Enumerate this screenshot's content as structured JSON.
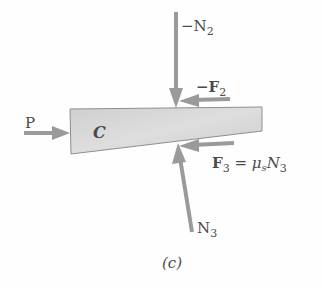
{
  "diagram": {
    "body": {
      "label": "C",
      "fill": "#d0d0d0",
      "stroke": "#8a8a8a"
    },
    "arrow_color": "#9a9a9a",
    "text_color": "#4a4a4a",
    "forces": [
      {
        "id": "P",
        "label": "P"
      },
      {
        "id": "neg_N2",
        "label_prefix": "−N",
        "subscript": "2"
      },
      {
        "id": "neg_F2",
        "label_prefix": "−F",
        "subscript": "2"
      },
      {
        "id": "F3",
        "label_prefix": "F",
        "subscript": "3",
        "eq": " = ",
        "mu": "μ",
        "mu_sub": "s",
        "N": "N",
        "N_sub": "3"
      },
      {
        "id": "N3",
        "label_prefix": "N",
        "subscript": "3"
      }
    ],
    "caption": "(c)"
  }
}
